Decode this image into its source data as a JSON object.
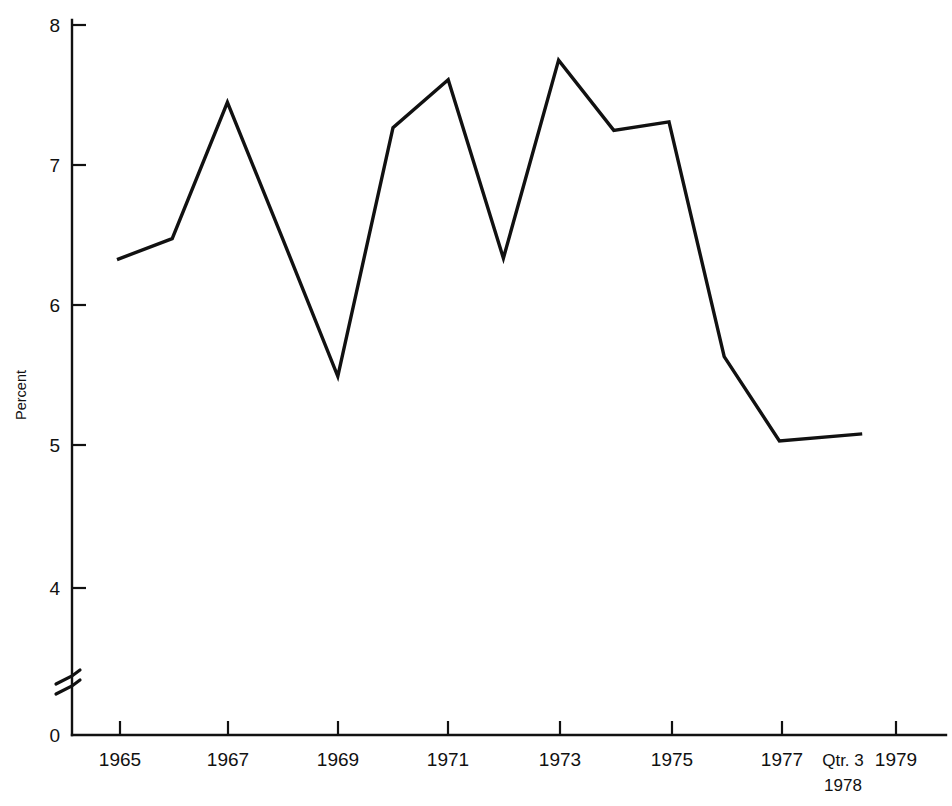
{
  "chart_data": {
    "type": "line",
    "title": "",
    "xlabel": "",
    "ylabel": "Percent",
    "ylim": [
      0,
      8
    ],
    "yticks": [
      0,
      4,
      5,
      6,
      7,
      8
    ],
    "ytick_labels": [
      "0",
      "4",
      "5",
      "6",
      "7",
      "8"
    ],
    "axis_break": true,
    "axis_break_between": [
      0,
      4
    ],
    "grid": false,
    "legend": false,
    "x": [
      1965,
      1966,
      1967,
      1968,
      1969,
      1970,
      1971,
      1972,
      1973,
      1974,
      1975,
      1976,
      1977,
      1978.5
    ],
    "xtick_labels_shown": [
      "1965",
      "1967",
      "1969",
      "1971",
      "1973",
      "1975",
      "1977",
      "Qtr. 3",
      "1979"
    ],
    "categories": [
      "1965",
      "1966",
      "1967",
      "1968",
      "1969",
      "1970",
      "1971",
      "1972",
      "1973",
      "1974",
      "1975",
      "1976",
      "1977",
      "Qtr. 3 1978"
    ],
    "values": [
      6.33,
      6.48,
      7.45,
      6.48,
      5.5,
      7.27,
      7.61,
      6.34,
      7.75,
      7.25,
      7.31,
      5.64,
      5.04,
      5.09
    ],
    "series": [
      {
        "name": "Percent",
        "values": [
          6.33,
          6.48,
          7.45,
          6.48,
          5.5,
          7.27,
          7.61,
          6.34,
          7.75,
          7.25,
          7.31,
          5.64,
          5.04,
          5.09
        ]
      }
    ],
    "line_color": "#111111"
  },
  "axes": {
    "y_axis_name": "Percent",
    "y_tick_labels": [
      "8",
      "7",
      "6",
      "5",
      "4",
      "0"
    ],
    "x_tick_labels": [
      "1965",
      "1967",
      "1969",
      "1971",
      "1973",
      "1975",
      "1977",
      "1979"
    ],
    "x_annotation_line1": "Qtr. 3",
    "x_annotation_line2": "1978"
  }
}
